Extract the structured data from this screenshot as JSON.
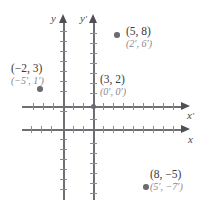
{
  "figure": {
    "axes": [
      {
        "name": "y",
        "label": "y",
        "kind": "vertical",
        "system": "unprimed"
      },
      {
        "name": "yp",
        "label": "y",
        "prime": "′",
        "kind": "vertical",
        "system": "primed"
      },
      {
        "name": "x",
        "label": "x",
        "kind": "horizontal",
        "system": "unprimed"
      },
      {
        "name": "xp",
        "label": "x",
        "prime": "′",
        "kind": "horizontal",
        "system": "primed"
      }
    ],
    "points": [
      {
        "id": "p-5-8",
        "primary": "(5, 8)",
        "secondary": "(2′, 6′)",
        "xy": [
          5,
          8
        ],
        "xy_primed": [
          2,
          6
        ]
      },
      {
        "id": "p-neg2-3",
        "primary": "(−2, 3)",
        "secondary": "(−5′, 1′)",
        "xy": [
          -2,
          3
        ],
        "xy_primed": [
          -5,
          1
        ]
      },
      {
        "id": "p-3-2",
        "primary": "(3, 2)",
        "secondary": "(0′, 0′)",
        "xy": [
          3,
          2
        ],
        "xy_primed": [
          0,
          0
        ]
      },
      {
        "id": "p-8-neg5",
        "primary": "(8, −5)",
        "secondary": "(5′, −7′)",
        "xy": [
          8,
          -5
        ],
        "xy_primed": [
          5,
          -7
        ]
      }
    ],
    "colors": {
      "axis": "#6e6e74",
      "tick": "#8a8a90",
      "dot": "#6b6b72",
      "primary_text": "#3a3a40",
      "secondary_text": "#87878e",
      "background": "#ffffff"
    }
  }
}
